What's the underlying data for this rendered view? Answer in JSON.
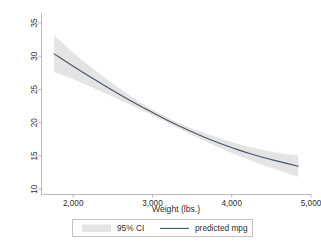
{
  "chart_data": {
    "type": "line",
    "title": "",
    "subtitle": "",
    "xlabel": "Weight (lbs.)",
    "ylabel": "",
    "xlim": [
      1600,
      5000
    ],
    "ylim": [
      9.2,
      36.5
    ],
    "xticks": [
      2000,
      3000,
      4000,
      5000
    ],
    "xtick_labels": [
      "2,000",
      "3,000",
      "4,000",
      "5,000"
    ],
    "yticks": [
      10,
      15,
      20,
      25,
      30,
      35
    ],
    "ytick_labels": [
      "10",
      "15",
      "20",
      "25",
      "30",
      "35"
    ],
    "ytick_rotation": 90,
    "grid": false,
    "legend_position": "bottom",
    "legend": [
      {
        "key": "ci-band",
        "label": "95% CI",
        "marker": "area-swatch",
        "color": "#e4e4e4"
      },
      {
        "key": "predicted-line",
        "label": "predicted mpg",
        "marker": "line",
        "color": "#47566b"
      }
    ],
    "series": [
      {
        "name": "predicted mpg",
        "type": "line",
        "color": "#47566b",
        "x": [
          1760,
          1900,
          2050,
          2200,
          2350,
          2500,
          2650,
          2800,
          2950,
          3100,
          3250,
          3400,
          3550,
          3700,
          3850,
          4000,
          4150,
          4300,
          4450,
          4600,
          4840
        ],
        "y": [
          30.35,
          29.25,
          28.1,
          27.0,
          25.9,
          24.85,
          23.8,
          22.8,
          21.85,
          20.9,
          20.0,
          19.15,
          18.35,
          17.6,
          16.9,
          16.25,
          15.65,
          15.1,
          14.6,
          14.15,
          13.45
        ]
      },
      {
        "name": "95% CI",
        "type": "band",
        "color": "#e4e4e4",
        "x": [
          1760,
          1900,
          2050,
          2200,
          2350,
          2500,
          2650,
          2800,
          2950,
          3100,
          3250,
          3400,
          3550,
          3700,
          3850,
          4000,
          4150,
          4300,
          4450,
          4600,
          4840
        ],
        "y_lower": [
          27.6,
          27.0,
          26.3,
          25.5,
          24.7,
          23.9,
          23.1,
          22.25,
          21.4,
          20.5,
          19.6,
          18.7,
          17.85,
          17.0,
          16.2,
          15.45,
          14.75,
          14.05,
          13.4,
          12.8,
          11.85
        ],
        "y_upper": [
          33.1,
          31.6,
          30.0,
          28.6,
          27.2,
          25.9,
          24.6,
          23.4,
          22.3,
          21.3,
          20.4,
          19.6,
          18.9,
          18.25,
          17.65,
          17.1,
          16.6,
          16.15,
          15.75,
          15.4,
          15.05
        ]
      }
    ]
  },
  "axes": {
    "x_title": "Weight (lbs.)",
    "y_title": ""
  },
  "colors": {
    "background": "#ffffff",
    "axis": "#a8a8a8",
    "text": "#2f2f2f",
    "ci_band": "#e4e4e4",
    "prediction_line": "#47566b",
    "legend_border": "#b4b4b4"
  }
}
